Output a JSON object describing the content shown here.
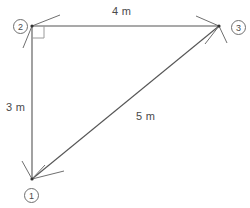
{
  "diagram": {
    "type": "right-triangle-geometry",
    "stroke_color": "#555555",
    "label_color": "#4a4a4a",
    "background_color": "#ffffff",
    "vertices": [
      {
        "id": "1",
        "label": "1",
        "x": 32,
        "y": 179
      },
      {
        "id": "2",
        "label": "2",
        "x": 32,
        "y": 26
      },
      {
        "id": "3",
        "label": "3",
        "x": 219,
        "y": 26
      }
    ],
    "sides": [
      {
        "id": "side-12",
        "from": "1",
        "to": "2",
        "label": "3 m",
        "length": 3,
        "unit": "m"
      },
      {
        "id": "side-23",
        "from": "2",
        "to": "3",
        "label": "4 m",
        "length": 4,
        "unit": "m"
      },
      {
        "id": "side-13",
        "from": "1",
        "to": "3",
        "label": "5 m",
        "length": 5,
        "unit": "m"
      }
    ],
    "right_angle": {
      "at_vertex": "2",
      "marker": "square",
      "degrees": 90
    }
  }
}
